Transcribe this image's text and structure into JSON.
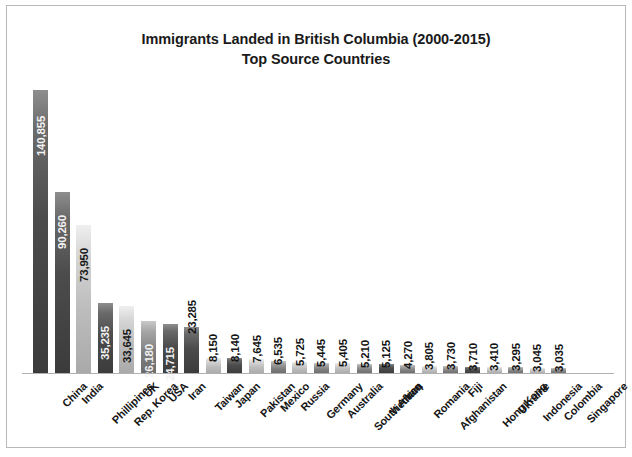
{
  "chart_data": {
    "type": "bar",
    "title": "Immigrants Landed in British Columbia (2000-2015)",
    "subtitle": "Top Source Countries",
    "xlabel": "",
    "ylabel": "",
    "ylim": [
      0,
      140855
    ],
    "grid": false,
    "legend": "none",
    "orientation": "vertical",
    "value_label_rotation": -90,
    "category_label_rotation": -45,
    "categories": [
      "China",
      "India",
      "Phillipines",
      "Rep. Korea",
      "UK",
      "USA",
      "Iran",
      "Taiwan",
      "Japan",
      "Pakistan",
      "Mexico",
      "Russia",
      "Germany",
      "Australia",
      "South Africa",
      "Vietnam",
      "Iraq",
      "Romania",
      "Afghanistan",
      "Fiji",
      "Hong Kong",
      "Ukraine",
      "Indonesia",
      "Colombia",
      "Singapore"
    ],
    "values": [
      140855,
      90260,
      73950,
      35235,
      33645,
      26180,
      24715,
      23285,
      8150,
      8140,
      7645,
      6535,
      5725,
      5445,
      5405,
      5210,
      5125,
      4270,
      3805,
      3730,
      3710,
      3410,
      3295,
      3045,
      3035
    ],
    "value_labels": [
      "140,855",
      "90,260",
      "73,950",
      "35,235",
      "33,645",
      "26,180",
      "24,715",
      "23,285",
      "8,150",
      "8,140",
      "7,645",
      "6,535",
      "5,725",
      "5,445",
      "5,405",
      "5,210",
      "5,125",
      "4,270",
      "3,805",
      "3,730",
      "3,710",
      "3,410",
      "3,295",
      "3,045",
      "3,035"
    ],
    "bar_shades": [
      "dark",
      "dark",
      "light",
      "dark",
      "light",
      "mid",
      "dark",
      "dark",
      "light",
      "dark",
      "light",
      "mid",
      "light",
      "mid",
      "light",
      "mid",
      "dark",
      "mid",
      "light",
      "mid",
      "dark",
      "light",
      "mid",
      "light",
      "mid"
    ],
    "colors": {
      "bar_dark": "#4c4c4c",
      "bar_light": "#c9c9c9",
      "bar_mid": "#8c8c8c",
      "axis_line": "#b0b0b0",
      "frame_border": "#b8b8b8",
      "text": "#1a1a1a",
      "background": "#ffffff"
    }
  }
}
